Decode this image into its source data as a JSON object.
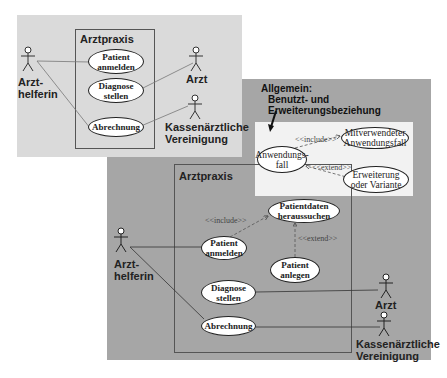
{
  "diagram_simple": {
    "system_title": "Arztpraxis",
    "actors": [
      {
        "id": "arzthelferin",
        "label_line1": "Arzt-",
        "label_line2": "helferin"
      },
      {
        "id": "arzt",
        "label": "Arzt"
      },
      {
        "id": "kv",
        "label_line1": "Kassenärztliche",
        "label_line2": "Vereinigung"
      }
    ],
    "use_cases": [
      {
        "id": "patient_anmelden",
        "line1": "Patient",
        "line2": "anmelden"
      },
      {
        "id": "diagnose_stellen",
        "line1": "Diagnose",
        "line2": "stellen"
      },
      {
        "id": "abrechnung",
        "line1": "Abrechnung"
      }
    ]
  },
  "legend": {
    "title": "Allgemein:",
    "subtitle_line1": "Benutzt- und",
    "subtitle_line2": "Erweiterungsbeziehung",
    "base_use_case_line1": "Anwendungs-",
    "base_use_case_line2": "fall",
    "included_line1": "Mitverwendeter",
    "included_line2": "Anwendungsfall",
    "extension_line1": "Erweiterung",
    "extension_line2": "oder Variante",
    "include_label": "<<include>>",
    "extend_label": "<<extend>>"
  },
  "diagram_extended": {
    "system_title": "Arztpraxis",
    "actors": [
      {
        "id": "arzthelferin",
        "label_line1": "Arzt-",
        "label_line2": "helferin"
      },
      {
        "id": "arzt",
        "label": "Arzt"
      },
      {
        "id": "kv",
        "label_line1": "Kassenärztliche",
        "label_line2": "Vereinigung"
      }
    ],
    "use_cases": [
      {
        "id": "patientdaten_heraussuchen",
        "line1": "Patientdaten",
        "line2": "heraussuchen"
      },
      {
        "id": "patient_anmelden",
        "line1": "Patient",
        "line2": "anmelden"
      },
      {
        "id": "patient_anlegen",
        "line1": "Patient",
        "line2": "anlegen"
      },
      {
        "id": "diagnose_stellen",
        "line1": "Diagnose",
        "line2": "stellen"
      },
      {
        "id": "abrechnung",
        "line1": "Abrechnung"
      }
    ],
    "include_label": "<<include>>",
    "extend_label": "<<extend>>"
  },
  "colors": {
    "light_panel": "#dadada",
    "dark_panel": "#a6a6a6",
    "legend_box": "#f2f2f2",
    "use_case_fill": "#ffffff"
  }
}
